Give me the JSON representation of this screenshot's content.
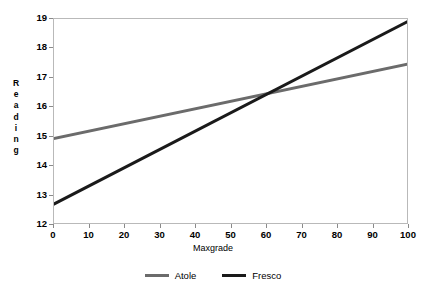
{
  "chart_data": {
    "type": "line",
    "title": "",
    "xlabel": "Maxgrade",
    "ylabel": "Reading",
    "ylabel_stacked": [
      "R",
      "e",
      "a",
      "d",
      "i",
      "n",
      "g"
    ],
    "xlim": [
      0,
      100
    ],
    "ylim": [
      12,
      19
    ],
    "xticks": [
      0,
      10,
      20,
      30,
      40,
      50,
      60,
      70,
      80,
      90,
      100
    ],
    "xtick_labels": [
      "0",
      "10",
      "20",
      "30",
      "40",
      "50",
      "60",
      "70",
      "80",
      "90",
      "100"
    ],
    "yticks": [
      12,
      13,
      14,
      15,
      16,
      17,
      18,
      19
    ],
    "ytick_labels": [
      "12",
      "13",
      "14",
      "15",
      "16",
      "17",
      "18",
      "19"
    ],
    "grid": false,
    "legend_position": "bottom-center",
    "series": [
      {
        "name": "Atole",
        "color": "#6b6b6b",
        "x": [
          0,
          100
        ],
        "values": [
          14.9,
          17.45
        ]
      },
      {
        "name": "Fresco",
        "color": "#1a1a1a",
        "x": [
          0,
          100
        ],
        "values": [
          12.65,
          18.9
        ]
      }
    ],
    "intersection": {
      "x": 61,
      "y": 16.45
    }
  },
  "legend": {
    "entries": [
      {
        "label": "Atole",
        "color": "#6b6b6b"
      },
      {
        "label": "Fresco",
        "color": "#1a1a1a"
      }
    ]
  },
  "axes": {
    "x_title": "Maxgrade",
    "y_title": "Reading"
  }
}
